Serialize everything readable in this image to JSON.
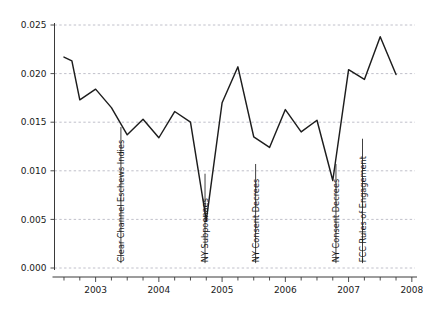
{
  "chart_data": {
    "type": "line",
    "title": "",
    "subtitle": "",
    "xlabel": "",
    "ylabel": "",
    "xlim": [
      2002.35,
      2008.05
    ],
    "ylim": [
      0.0,
      0.025
    ],
    "grid": true,
    "legend": "none",
    "y_ticks": [
      "0.000",
      "0.005",
      "0.010",
      "0.015",
      "0.020",
      "0.025"
    ],
    "y_tick_values": [
      0.0,
      0.005,
      0.01,
      0.015,
      0.02,
      0.025
    ],
    "x_ticks": [
      "2003",
      "2004",
      "2005",
      "2006",
      "2007",
      "2008"
    ],
    "x_tick_values": [
      2003,
      2004,
      2005,
      2006,
      2007,
      2008
    ],
    "x_minor_tick_step": 0.25,
    "line_color": "#1d1d1d",
    "grid_color": "#b9b9c4",
    "axis_color": "#3a3a3a",
    "series": [
      {
        "name": "series-1",
        "x": [
          2002.5,
          2002.625,
          2002.75,
          2003.0,
          2003.25,
          2003.5,
          2003.75,
          2004.0,
          2004.25,
          2004.5,
          2004.75,
          2005.0,
          2005.25,
          2005.5,
          2005.75,
          2006.0,
          2006.25,
          2006.5,
          2006.75,
          2007.0,
          2007.25,
          2007.5,
          2007.75
        ],
        "y": [
          0.0217,
          0.0213,
          0.0173,
          0.0184,
          0.0165,
          0.0137,
          0.0153,
          0.0134,
          0.0161,
          0.015,
          0.0049,
          0.017,
          0.0207,
          0.0135,
          0.0124,
          0.0163,
          0.014,
          0.0152,
          0.009,
          0.0204,
          0.0194,
          0.0238,
          0.0199
        ]
      }
    ],
    "annotations": [
      {
        "label": "Clear Channel Eschews Indies",
        "x": 2003.4,
        "top_y": 0.0145,
        "bottom_y": 0.0005
      },
      {
        "label": "NY Subpoenaes",
        "x": 2004.73,
        "top_y": 0.0097,
        "bottom_y": 0.0005
      },
      {
        "label": "NY Consent Decrees",
        "x": 2005.53,
        "top_y": 0.0107,
        "bottom_y": 0.0005
      },
      {
        "label": "NY Consent Decrees",
        "x": 2006.8,
        "top_y": 0.0107,
        "bottom_y": 0.0005
      },
      {
        "label": "FCC Rules of Engagement",
        "x": 2007.22,
        "top_y": 0.0133,
        "bottom_y": 0.0005
      }
    ]
  }
}
